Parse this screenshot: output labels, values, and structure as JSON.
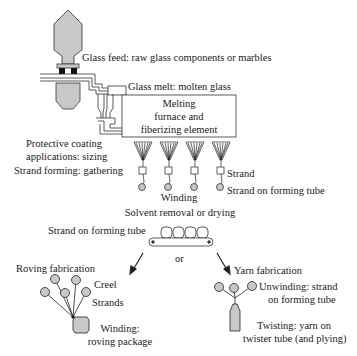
{
  "diagram": {
    "colors": {
      "fill": "#c8c8c8",
      "stroke": "#333333",
      "background": "#ffffff"
    },
    "labels": {
      "glass_feed": "Glass feed: raw glass components or marbles",
      "glass_melt": "Glass melt: molten glass",
      "furnace_line1": "Melting",
      "furnace_line2": "furnace and",
      "furnace_line3": "fiberizing element",
      "coating_line1": "Protective coating",
      "coating_line2": "applications: sizing",
      "strand_forming": "Strand forming: gathering",
      "strand": "Strand",
      "strand_on_tube": "Strand on forming tube",
      "winding": "Winding",
      "solvent_removal": "Solvent removal or drying",
      "conveyor_label": "Strand on forming tube",
      "or": "or",
      "roving_fabrication": "Roving fabrication",
      "creel": "Creel",
      "strands": "Strands",
      "roving_winding_line1": "Winding:",
      "roving_winding_line2": "roving package",
      "yarn_fabrication": "Yarn fabrication",
      "unwinding_line1": "Unwinding: strand",
      "unwinding_line2": "on forming tube",
      "twisting_line1": "Twisting: yarn on",
      "twisting_line2": "twister tube (and plying)"
    },
    "bushing_count": 4,
    "conveyor_tube_count": 4,
    "roving_creel_count": 5,
    "yarn_unwind_count": 3
  }
}
